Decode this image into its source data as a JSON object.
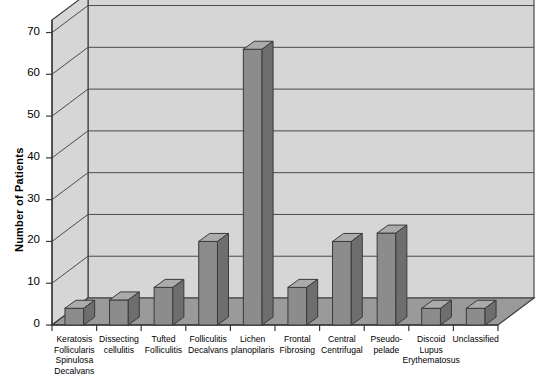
{
  "chart_data": {
    "type": "bar",
    "title": "",
    "subtitle": "",
    "xlabel": "",
    "ylabel": "Number of Patients",
    "ylim": [
      0,
      73
    ],
    "yticks": [
      0,
      10,
      20,
      30,
      40,
      50,
      60,
      70
    ],
    "ytick_labels": [
      "0",
      "10",
      "20",
      "30",
      "40",
      "50",
      "60",
      "70"
    ],
    "grid": true,
    "legend": "none",
    "style": "3d-bar",
    "categories": [
      "Keratosis\nFollicularis\nSpinulosa\nDecalvans",
      "Dissecting\ncellulitis",
      "Tufted\nFolliculitis",
      "Folliculitis\nDecalvans",
      "Lichen\nplanopilaris",
      "Frontal\nFibrosing",
      "Central\nCentrifugal",
      "Pseudo-\npelade",
      "Discoid\nLupus\nErythematosus",
      "Unclassified"
    ],
    "values": [
      4,
      6,
      9,
      20,
      66,
      9,
      20,
      22,
      4,
      4
    ]
  },
  "colors": {
    "bar_front": "#8c8c8c",
    "bar_top": "#ababab",
    "bar_side": "#6e6e6e",
    "bar_outline": "#3a3a3a",
    "plot_background": "#d6d6d6",
    "floor": "#9a9a9a",
    "gridline": "#4a4a4a",
    "axis": "#3a3a3a",
    "text": "#000000",
    "page_background": "#ffffff"
  }
}
